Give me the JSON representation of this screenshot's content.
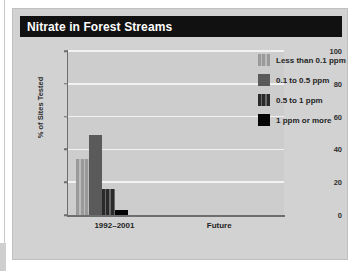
{
  "figure": {
    "title": "Nitrate in Forest Streams"
  },
  "colors": {
    "panel_bg": "#d2d2d2",
    "plot_bg": "#cdcdcd",
    "title_bar": "#111111",
    "title_text": "#ffffff",
    "gridline": "#f2f2f2",
    "axis": "#6e6e6e",
    "series_light_stripe": "#9a9a9a",
    "series_mid_solid": "#5a5a5a",
    "series_dark_stripe": "#2a2a2a",
    "series_black": "#050505"
  },
  "legend": {
    "position": "top-right",
    "items": [
      {
        "label": "Less than 0.1 ppm",
        "swatch": "light-striped-swatch"
      },
      {
        "label": "0.1 to 0.5 ppm",
        "swatch": "mid-solid-swatch"
      },
      {
        "label": "0.5 to 1 ppm",
        "swatch": "dark-striped-swatch"
      },
      {
        "label": "1 ppm or more",
        "swatch": "black-solid-swatch"
      }
    ]
  },
  "chart_data": {
    "type": "bar",
    "title": "Nitrate in Forest Streams",
    "xlabel": "",
    "ylabel": "% of Sites Tested",
    "ylim": [
      0,
      100
    ],
    "yticks": [
      0,
      20,
      40,
      60,
      80,
      100
    ],
    "grid": true,
    "categories": [
      "1992–2001",
      "Future"
    ],
    "series": [
      {
        "name": "Less than 0.1 ppm",
        "values": [
          34,
          0
        ]
      },
      {
        "name": "0.1 to 0.5 ppm",
        "values": [
          49,
          0
        ]
      },
      {
        "name": "0.5 to 1 ppm",
        "values": [
          16,
          0
        ]
      },
      {
        "name": "1 ppm or more",
        "values": [
          3,
          0
        ]
      }
    ]
  }
}
